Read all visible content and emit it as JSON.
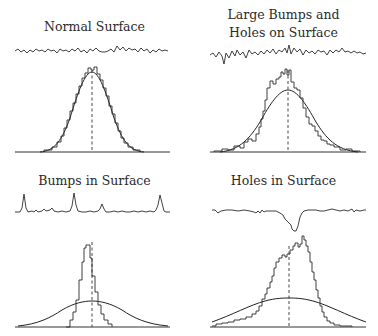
{
  "panels": [
    {
      "id": "normal",
      "title_lines": [
        "Normal Surface"
      ],
      "profile_type": "random-roughness",
      "histogram": "matches gaussian"
    },
    {
      "id": "large-bumps-holes",
      "title_lines": [
        "Large Bumps and",
        "Holes on Surface"
      ],
      "profile_type": "large-excursions",
      "histogram": "peaked, heavier tails than gaussian"
    },
    {
      "id": "bumps",
      "title_lines": [
        "Bumps in Surface"
      ],
      "profile_type": "positive-spikes",
      "histogram": "narrow, much taller than broad gaussian"
    },
    {
      "id": "holes",
      "title_lines": [
        "Holes in Surface"
      ],
      "profile_type": "single-deep-hole",
      "histogram": "skewed to the right, long left tail"
    }
  ],
  "colors": {
    "line": "#2b2b2b",
    "background": "#ffffff",
    "text": "#2a2a2a"
  }
}
